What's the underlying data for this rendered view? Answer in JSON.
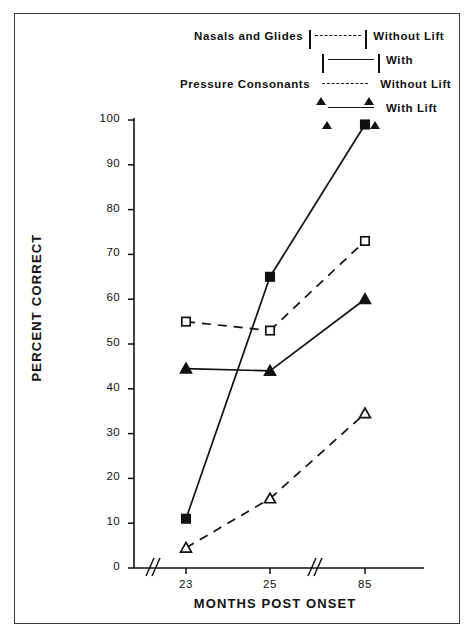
{
  "figure": {
    "legend": {
      "rows": [
        {
          "group_label": "Nasals and Glides",
          "condition_label": "Without Lift",
          "marker": "square-open",
          "line": "dashed"
        },
        {
          "group_label": "",
          "condition_label": "With",
          "marker": "square-filled",
          "line": "solid"
        },
        {
          "group_label": "Pressure Consonants",
          "condition_label": "Without Lift",
          "marker": "triangle-open",
          "line": "dashed"
        },
        {
          "group_label": "",
          "condition_label": "With Lift",
          "marker": "triangle-filled",
          "line": "solid"
        }
      ]
    }
  },
  "chart_data": {
    "type": "line",
    "title": "",
    "xlabel": "MONTHS POST ONSET",
    "ylabel": "PERCENT CORRECT",
    "categories": [
      "23",
      "25",
      "85"
    ],
    "x_tick_labels": [
      "23",
      "25",
      "85"
    ],
    "y_tick_labels": [
      "0",
      "10",
      "20",
      "30",
      "40",
      "50",
      "60",
      "70",
      "80",
      "90",
      "100"
    ],
    "ylim": [
      0,
      100
    ],
    "y_step": 10,
    "grid": false,
    "legend_position": "top",
    "axis_breaks": [
      "x-before-first-tick",
      "x-between-25-and-85"
    ],
    "series": [
      {
        "name": "Nasals and Glides Without Lift",
        "marker": "square-open",
        "line": "dashed",
        "color": "#111111",
        "values": [
          55,
          53,
          73
        ]
      },
      {
        "name": "Nasals and Glides With",
        "marker": "square-filled",
        "line": "solid",
        "color": "#111111",
        "values": [
          11,
          65,
          99
        ]
      },
      {
        "name": "Pressure Consonants Without Lift",
        "marker": "triangle-open",
        "line": "dashed",
        "color": "#111111",
        "values": [
          4.5,
          15.5,
          34.5
        ]
      },
      {
        "name": "Pressure Consonants With Lift",
        "marker": "triangle-filled",
        "line": "solid",
        "color": "#111111",
        "values": [
          44.5,
          44,
          60
        ]
      }
    ]
  }
}
